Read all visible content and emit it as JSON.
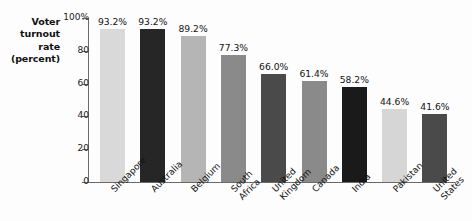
{
  "chart_data": {
    "type": "bar",
    "title": "",
    "subtitle": "",
    "xlabel": "",
    "ylabel": "Voter turnout rate (percent)",
    "ylabel_lines": [
      "Voter",
      "turnout",
      "rate",
      "(percent)"
    ],
    "ylim": [
      0,
      100
    ],
    "yticks": [
      0,
      20,
      40,
      60,
      80,
      100
    ],
    "ytick_labels": [
      "0",
      "20",
      "40",
      "60",
      "80",
      "100%"
    ],
    "grid": false,
    "legend": "none",
    "categories": [
      "Singapore",
      "Australia",
      "Belgium",
      "South Africa",
      "United Kingdom",
      "Canada",
      "India",
      "Pakistan",
      "United States"
    ],
    "category_label_lines": [
      [
        "Singapore"
      ],
      [
        "Australia"
      ],
      [
        "Belgium"
      ],
      [
        "South",
        "Africa"
      ],
      [
        "United",
        "Kingdom"
      ],
      [
        "Canada"
      ],
      [
        "India"
      ],
      [
        "Pakistan"
      ],
      [
        "United",
        "States"
      ]
    ],
    "values": [
      93.2,
      93.2,
      89.2,
      77.3,
      66.0,
      61.4,
      58.2,
      44.6,
      41.6
    ],
    "data_labels": [
      "93.2%",
      "93.2%",
      "89.2%",
      "77.3%",
      "66.0%",
      "61.4%",
      "58.2%",
      "44.6%",
      "41.6%"
    ],
    "bar_colors": [
      "#d9d9d9",
      "#262626",
      "#b5b5b5",
      "#8a8a8a",
      "#4a4a4a",
      "#8a8a8a",
      "#1a1a1a",
      "#d6d6d6",
      "#4a4a4a"
    ],
    "axis_color": "#6a6a6a",
    "background_color": "#fdfdfd",
    "text_color": "#111111"
  }
}
